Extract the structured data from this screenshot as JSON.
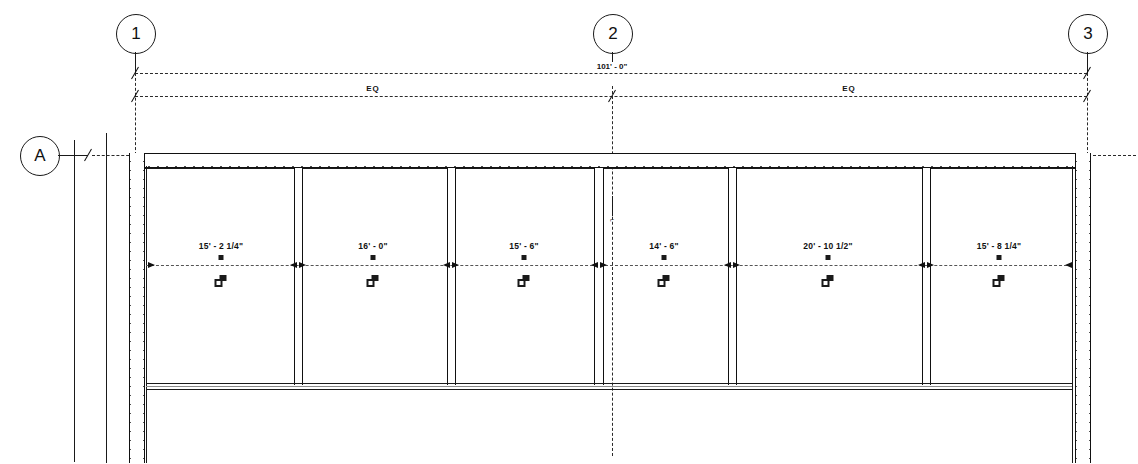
{
  "drawing": {
    "type": "floor-plan",
    "title": "Partial Floor Plan",
    "grid_bubbles_top": [
      {
        "label": "1",
        "x": 135
      },
      {
        "label": "2",
        "x": 612
      },
      {
        "label": "3",
        "x": 1087
      }
    ],
    "grid_bubbles_left": [
      {
        "label": "A",
        "y": 155
      }
    ],
    "overall_dimension": {
      "label": "101' - 0\"",
      "start_x": 135,
      "end_x": 1087
    },
    "equal_dimensions": [
      {
        "label": "EQ",
        "start_x": 135,
        "end_x": 612
      },
      {
        "label": "EQ",
        "start_x": 612,
        "end_x": 1087
      }
    ],
    "bay_dimensions": [
      {
        "label": "15' - 2 1/4\"",
        "start_x": 146,
        "end_x": 297,
        "center_x": 221
      },
      {
        "label": "16' - 0\"",
        "start_x": 297,
        "end_x": 450,
        "center_x": 373
      },
      {
        "label": "15' - 6\"",
        "start_x": 450,
        "end_x": 598,
        "center_x": 524
      },
      {
        "label": "14' - 6\"",
        "start_x": 598,
        "end_x": 731,
        "center_x": 664
      },
      {
        "label": "20' - 10 1/2\"",
        "start_x": 731,
        "end_x": 925,
        "center_x": 828
      },
      {
        "label": "15' - 8 1/4\"",
        "start_x": 925,
        "end_x": 1072,
        "center_x": 999
      }
    ],
    "window_tags": [
      {
        "name": "window-tag",
        "x": 221
      },
      {
        "name": "window-tag",
        "x": 373
      },
      {
        "name": "window-tag",
        "x": 524
      },
      {
        "name": "window-tag",
        "x": 664
      },
      {
        "name": "window-tag",
        "x": 828
      },
      {
        "name": "window-tag",
        "x": 999
      }
    ],
    "mullions_x": [
      297,
      450,
      598,
      731,
      925
    ],
    "centerline_marker": "⌐",
    "colors": {
      "line": "#1a1a1a",
      "hatch": "#333333",
      "background": "#ffffff",
      "dash": "#2b2b2b"
    }
  }
}
